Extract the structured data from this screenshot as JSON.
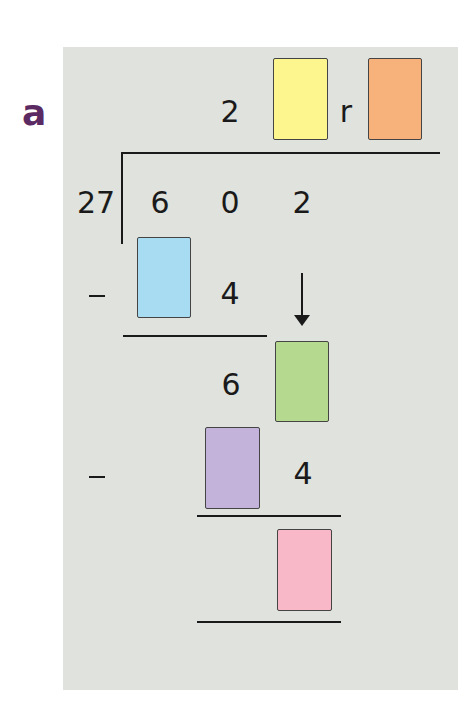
{
  "problem": {
    "label": "a",
    "divisor": "27",
    "dividend_digits": [
      "6",
      "0",
      "2"
    ],
    "quotient_known_digit": "2",
    "remainder_letter": "r",
    "step1_subtract_known_digit": "4",
    "step1_result_known_digit": "6",
    "step2_subtract_known_digit": "4",
    "operator_minus": "−"
  },
  "answer_boxes": [
    {
      "name": "quotient-units-box",
      "color": "#fdf68e"
    },
    {
      "name": "remainder-box",
      "color": "#f6b27a"
    },
    {
      "name": "first-product-tens-box",
      "color": "#a8dcf2"
    },
    {
      "name": "brought-down-digit-box",
      "color": "#b5d98e"
    },
    {
      "name": "second-product-tens-box",
      "color": "#c3b3db"
    },
    {
      "name": "final-remainder-box",
      "color": "#f8b8c8"
    }
  ],
  "colors": {
    "label": "#5b2a63",
    "panel": "#dfe2dd",
    "ink": "#1a1a1a"
  }
}
